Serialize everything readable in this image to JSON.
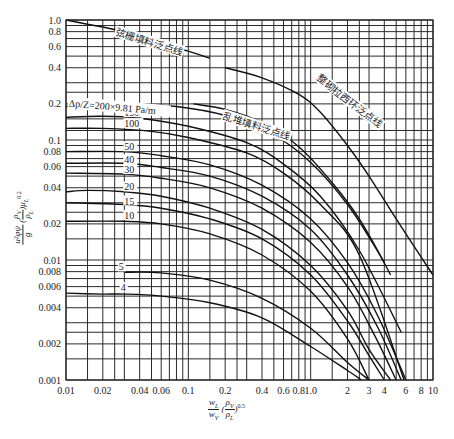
{
  "chart_data": {
    "type": "line",
    "title": "",
    "xscale": "log",
    "yscale": "log",
    "xlim": [
      0.01,
      10
    ],
    "ylim": [
      0.001,
      1.0
    ],
    "grid": true,
    "xlabel": "wL/wV (ρV/ρL)^0.5",
    "ylabel": "u²φψ/g (ρV/ρL) μL^0.2",
    "x_tick_labels": [
      "0.01",
      "0.02",
      "0.04",
      "0.06",
      "0.1",
      "0.2",
      "0.4",
      "0.6",
      "0.8",
      "1.0",
      "2",
      "3",
      "4",
      "6",
      "8",
      "10"
    ],
    "x_ticks": [
      0.01,
      0.02,
      0.04,
      0.06,
      0.1,
      0.2,
      0.4,
      0.6,
      0.8,
      1.0,
      2,
      3,
      4,
      6,
      8,
      10
    ],
    "y_tick_labels": [
      "1.0",
      "0.8",
      "0.6",
      "0.4",
      "0.2",
      "0.1",
      "0.08",
      "0.06",
      "0.04",
      "0.02",
      "0.01",
      "0.008",
      "0.006",
      "0.004",
      "0.002",
      "0.001"
    ],
    "y_ticks": [
      1.0,
      0.8,
      0.6,
      0.4,
      0.2,
      0.1,
      0.08,
      0.06,
      0.04,
      0.02,
      0.01,
      0.008,
      0.006,
      0.004,
      0.002,
      0.001
    ],
    "x_grid": [
      0.01,
      0.015,
      0.02,
      0.025,
      0.03,
      0.04,
      0.05,
      0.06,
      0.07,
      0.08,
      0.09,
      0.1,
      0.15,
      0.2,
      0.25,
      0.3,
      0.4,
      0.5,
      0.6,
      0.7,
      0.8,
      0.9,
      1.0,
      1.5,
      2,
      2.5,
      3,
      4,
      5,
      6,
      7,
      8,
      9,
      10
    ],
    "y_grid": [
      1.0,
      0.9,
      0.8,
      0.7,
      0.6,
      0.5,
      0.4,
      0.3,
      0.25,
      0.2,
      0.15,
      0.12,
      0.1,
      0.09,
      0.08,
      0.07,
      0.06,
      0.05,
      0.04,
      0.03,
      0.025,
      0.02,
      0.015,
      0.01,
      0.009,
      0.008,
      0.007,
      0.006,
      0.005,
      0.004,
      0.003,
      0.0025,
      0.002,
      0.0015,
      0.001
    ],
    "annotations": [
      {
        "text": "弦栅填料泛点线",
        "x": 0.025,
        "y": 0.75,
        "angle": 17
      },
      {
        "text": "Δp/Z=200×9.81 Pa/m",
        "x": 0.0105,
        "y": 0.19,
        "angle": 5
      },
      {
        "text": "乱堆填料泛点线",
        "x": 0.19,
        "y": 0.15,
        "angle": 18
      },
      {
        "text": "整砌拉西环泛点线",
        "x": 1.1,
        "y": 0.32,
        "angle": 38
      }
    ],
    "series": [
      {
        "name": "弦栅填料泛点线",
        "style": "flood",
        "x": [
          0.01,
          0.03,
          0.06,
          0.1,
          0.15
        ],
        "y": [
          1.0,
          0.8,
          0.64,
          0.55,
          0.48
        ]
      },
      {
        "name": "整砌拉西环泛点线",
        "style": "flood",
        "x": [
          0.2,
          0.4,
          0.8,
          1.2,
          2,
          3,
          5,
          7,
          10
        ],
        "y": [
          0.4,
          0.33,
          0.24,
          0.17,
          0.09,
          0.05,
          0.022,
          0.013,
          0.0075
        ]
      },
      {
        "name": "乱堆填料泛点线",
        "style": "flood",
        "x": [
          0.11,
          0.2,
          0.4,
          0.8,
          1.5,
          2.5,
          4.0
        ],
        "y": [
          0.2,
          0.18,
          0.14,
          0.088,
          0.044,
          0.022,
          0.0095
        ]
      },
      {
        "name": "200",
        "label": "200",
        "x": [
          0.01,
          0.03,
          0.08,
          0.2,
          0.5,
          1.0,
          2.0,
          3.5,
          4.5
        ],
        "y": [
          0.19,
          0.2,
          0.19,
          0.16,
          0.11,
          0.065,
          0.029,
          0.012,
          0.0075
        ]
      },
      {
        "name": "150",
        "label": "150",
        "label_at": [
          0.03,
          0.158
        ],
        "x": [
          0.01,
          0.02,
          0.04,
          0.1,
          0.3,
          0.6,
          1.2,
          2.5,
          5.5
        ],
        "y": [
          0.155,
          0.158,
          0.152,
          0.13,
          0.095,
          0.063,
          0.034,
          0.012,
          0.0025
        ]
      },
      {
        "name": "100",
        "label": "100",
        "label_at": [
          0.03,
          0.128
        ],
        "x": [
          0.01,
          0.02,
          0.05,
          0.1,
          0.3,
          0.6,
          1.2,
          2.5,
          5.8
        ],
        "y": [
          0.125,
          0.125,
          0.118,
          0.105,
          0.078,
          0.053,
          0.029,
          0.011,
          0.001
        ]
      },
      {
        "name": "50",
        "label": "50",
        "label_at": [
          0.03,
          0.082
        ],
        "x": [
          0.01,
          0.03,
          0.06,
          0.15,
          0.4,
          1.0,
          2.0,
          3.5,
          6.0
        ],
        "y": [
          0.08,
          0.08,
          0.074,
          0.062,
          0.042,
          0.022,
          0.0095,
          0.0035,
          0.001
        ]
      },
      {
        "name": "40",
        "label": "40",
        "label_at": [
          0.03,
          0.064
        ],
        "x": [
          0.01,
          0.03,
          0.06,
          0.15,
          0.4,
          1.0,
          2.0,
          3.5,
          5.5
        ],
        "y": [
          0.064,
          0.064,
          0.059,
          0.05,
          0.034,
          0.018,
          0.0075,
          0.0028,
          0.001
        ]
      },
      {
        "name": "30",
        "label": "30",
        "label_at": [
          0.03,
          0.053
        ],
        "x": [
          0.01,
          0.03,
          0.06,
          0.15,
          0.4,
          1.0,
          2.0,
          3.3,
          5.0
        ],
        "y": [
          0.053,
          0.052,
          0.048,
          0.04,
          0.027,
          0.014,
          0.006,
          0.0024,
          0.001
        ]
      },
      {
        "name": "20",
        "label": "20",
        "label_at": [
          0.03,
          0.038
        ],
        "x": [
          0.01,
          0.015,
          0.03,
          0.06,
          0.15,
          0.4,
          1.0,
          2.0,
          3.0,
          4.5
        ],
        "y": [
          0.037,
          0.038,
          0.037,
          0.034,
          0.027,
          0.018,
          0.009,
          0.0038,
          0.0018,
          0.001
        ]
      },
      {
        "name": "15",
        "label": "15",
        "label_at": [
          0.03,
          0.029
        ],
        "x": [
          0.01,
          0.03,
          0.06,
          0.15,
          0.4,
          1.0,
          2.0,
          3.0,
          4.0
        ],
        "y": [
          0.03,
          0.029,
          0.027,
          0.022,
          0.015,
          0.0075,
          0.0031,
          0.0016,
          0.001
        ]
      },
      {
        "name": "10",
        "label": "10",
        "label_at": [
          0.03,
          0.022
        ],
        "x": [
          0.01,
          0.03,
          0.06,
          0.15,
          0.4,
          1.0,
          2.0,
          3.0
        ],
        "y": [
          0.021,
          0.021,
          0.02,
          0.0165,
          0.011,
          0.0055,
          0.0022,
          0.001
        ]
      },
      {
        "name": "5",
        "label": "5",
        "label_at": [
          0.027,
          0.0082
        ],
        "x": [
          0.03,
          0.06,
          0.15,
          0.4,
          1.0,
          2.0,
          3.0
        ],
        "y": [
          0.0079,
          0.0078,
          0.0068,
          0.0048,
          0.0027,
          0.0014,
          0.001
        ]
      },
      {
        "name": "4",
        "label": "4",
        "label_at": [
          0.028,
          0.0055
        ],
        "x": [
          0.01,
          0.02,
          0.03,
          0.06,
          0.15,
          0.4,
          1.0,
          2.0,
          2.6
        ],
        "y": [
          0.0053,
          0.0052,
          0.0052,
          0.005,
          0.0044,
          0.0033,
          0.0019,
          0.0012,
          0.001
        ]
      }
    ]
  },
  "axes": {
    "x_label_main": "w",
    "x_label_num_sub": "L",
    "x_label_den_sub": "V",
    "x_label_rho_num_sub": "V",
    "x_label_rho_den_sub": "L",
    "x_label_exp": "0.5",
    "y_label_head": "u²φψ",
    "y_label_den": "g",
    "y_label_rho_num_sub": "V",
    "y_label_rho_den_sub": "L",
    "y_label_mu": "μ",
    "y_label_mu_sub": "L",
    "y_label_exp": "0.2"
  }
}
